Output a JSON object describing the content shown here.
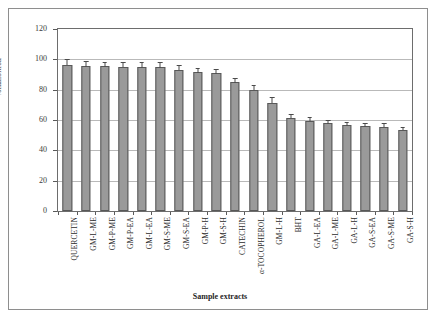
{
  "figure": {
    "background_color": "#ffffff",
    "frame_color": "#8e8e8e",
    "bar_fill_color": "#9a9a9a",
    "bar_edge_color": "#585858",
    "gridline_color": "#b9b9b9"
  },
  "chart_data": {
    "type": "bar",
    "title": "",
    "xlabel": "Sample extracts",
    "ylabel": "%Inhibition",
    "ylim": [
      0,
      120
    ],
    "ytick_labels": [
      "0",
      "20",
      "40",
      "60",
      "80",
      "100",
      "120"
    ],
    "ytick_values": [
      0,
      20,
      40,
      60,
      80,
      100,
      120
    ],
    "grid": true,
    "legend": "none",
    "orientation": "vertical",
    "error_bars": "standard deviation",
    "categories": [
      "QUERCETIN",
      "GM-L-ME",
      "GM-P-ME",
      "GM-P-EA",
      "GM-L-EA",
      "GM-S-ME",
      "GM-S-EA",
      "GM-P-H",
      "GM-S-H",
      "CATECHIN",
      "α-TOCOPHEROL",
      "GM-L-H",
      "BHT",
      "GA-L-EA",
      "GA-L-ME",
      "GA-L-H",
      "GA-S-EA",
      "GA-S-ME",
      "GA-S-H"
    ],
    "values": [
      96.5,
      95.5,
      95.3,
      95.2,
      95.0,
      94.8,
      93.3,
      91.5,
      90.8,
      85.0,
      80.0,
      71.5,
      61.5,
      59.5,
      57.8,
      56.5,
      56.0,
      55.5,
      53.5
    ],
    "errors": [
      3.5,
      3.5,
      3.0,
      3.2,
      3.2,
      3.3,
      3.0,
      3.0,
      3.0,
      3.0,
      3.0,
      3.5,
      2.5,
      2.2,
      2.2,
      2.0,
      2.0,
      2.2,
      2.0
    ]
  }
}
